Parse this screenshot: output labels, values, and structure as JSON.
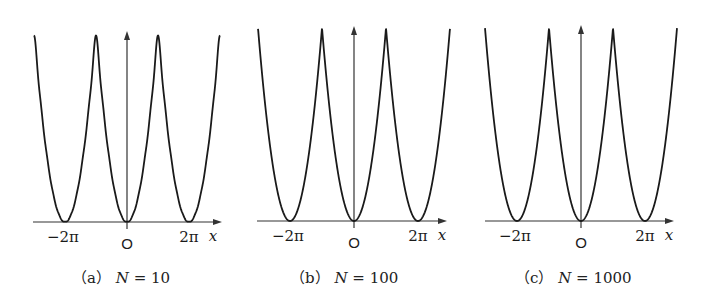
{
  "chart_data": [
    {
      "type": "line",
      "title": "",
      "caption": "(a) N = 10",
      "caption_letter": "a",
      "N": 10,
      "function": "S_N(x) = pi^2/3 + sum_{n=1}^{N} 4(-1)^n cos(n x) / n^2  (Fourier partial sum of 2pi-periodic x^2)",
      "xlabel": "x",
      "ylabel": "",
      "x_tick_labels": [
        "−2π",
        "O",
        "2π"
      ],
      "x_ticks": [
        -6.2832,
        0,
        6.2832
      ],
      "xlim": [
        -9.4248,
        9.4248
      ],
      "ylim": [
        0,
        9.8696
      ],
      "minima_x": [
        -6.2832,
        0,
        6.2832
      ],
      "peaks_x": [
        -3.1416,
        3.1416
      ],
      "peak_y": 9.8696,
      "grid": false,
      "legend": null
    },
    {
      "type": "line",
      "title": "",
      "caption": "(b) N = 100",
      "caption_letter": "b",
      "N": 100,
      "function": "S_N(x) = pi^2/3 + sum_{n=1}^{N} 4(-1)^n cos(n x) / n^2",
      "xlabel": "x",
      "ylabel": "",
      "x_tick_labels": [
        "−2π",
        "O",
        "2π"
      ],
      "x_ticks": [
        -6.2832,
        0,
        6.2832
      ],
      "xlim": [
        -9.4248,
        9.4248
      ],
      "ylim": [
        0,
        9.8696
      ],
      "minima_x": [
        -6.2832,
        0,
        6.2832
      ],
      "peaks_x": [
        -3.1416,
        3.1416
      ],
      "peak_y": 9.8696,
      "grid": false,
      "legend": null
    },
    {
      "type": "line",
      "title": "",
      "caption": "(c) N = 1000",
      "caption_letter": "c",
      "N": 1000,
      "function": "S_N(x) = pi^2/3 + sum_{n=1}^{N} 4(-1)^n cos(n x) / n^2",
      "xlabel": "x",
      "ylabel": "",
      "x_tick_labels": [
        "−2π",
        "O",
        "2π"
      ],
      "x_ticks": [
        -6.2832,
        0,
        6.2832
      ],
      "xlim": [
        -9.4248,
        9.4248
      ],
      "ylim": [
        0,
        9.8696
      ],
      "minima_x": [
        -6.2832,
        0,
        6.2832
      ],
      "peaks_x": [
        -3.1416,
        3.1416
      ],
      "peak_y": 9.8696,
      "grid": false,
      "legend": null
    }
  ],
  "panels": [
    {
      "caption": {
        "open": "（",
        "letter": "a",
        "close": "）",
        "n_var": "N",
        "eq": " = ",
        "n_value": "10"
      },
      "labels": {
        "neg2pi": "−2π",
        "origin": "O",
        "pos2pi": "2π",
        "xvar": "x"
      },
      "layout": {
        "left": 0,
        "origin_x": 127,
        "axis_y": 222,
        "px_per_pi": 31,
        "peak_px": 194,
        "axis_left": 33,
        "axis_right": 222,
        "yaxis_top": 31,
        "caption_x": 72
      }
    },
    {
      "caption": {
        "open": "（",
        "letter": "b",
        "close": "）",
        "n_var": "N",
        "eq": " = ",
        "n_value": "100"
      },
      "labels": {
        "neg2pi": "−2π",
        "origin": "O",
        "pos2pi": "2π",
        "xvar": "x"
      },
      "layout": {
        "left": 0,
        "origin_x": 354,
        "axis_y": 221,
        "px_per_pi": 32,
        "peak_px": 193,
        "axis_left": 257,
        "axis_right": 447,
        "yaxis_top": 26,
        "caption_x": 290
      }
    },
    {
      "caption": {
        "open": "（",
        "letter": "c",
        "close": "）",
        "n_var": "N",
        "eq": " = ",
        "n_value": "1000"
      },
      "labels": {
        "neg2pi": "−2π",
        "origin": "O",
        "pos2pi": "2π",
        "xvar": "x"
      },
      "layout": {
        "left": 0,
        "origin_x": 581,
        "axis_y": 221,
        "px_per_pi": 32,
        "peak_px": 193,
        "axis_left": 485,
        "axis_right": 674,
        "yaxis_top": 25,
        "caption_x": 515
      }
    }
  ],
  "style": {
    "curve_color": "#1a1a1a",
    "axis_color": "#333333",
    "background": "#ffffff"
  }
}
